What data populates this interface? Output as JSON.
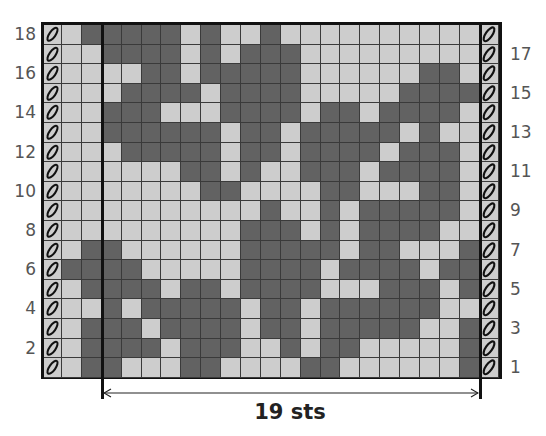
{
  "chart_data": {
    "type": "table",
    "title": "",
    "legend": {
      "D": "dark (contrast colour)",
      "L": "light (main colour)",
      "E": "edge slip stitch"
    },
    "colors": {
      "dark": "#626262",
      "light": "#cdcdcd",
      "grid": "#3a3a3a",
      "border": "#111111"
    },
    "repeat_label": "19 sts",
    "left_row_labels": [
      "18",
      "16",
      "14",
      "12",
      "10",
      "8",
      "6",
      "4",
      "2"
    ],
    "right_row_labels": [
      "17",
      "15",
      "13",
      "11",
      "9",
      "7",
      "5",
      "3",
      "1"
    ],
    "rows": [
      {
        "row": 18,
        "cells": "LDDDDDLDLLDLLLLLLLLLL"
      },
      {
        "row": 17,
        "cells": "LLDDDDLDLDDDLLLLLLLLL"
      },
      {
        "row": 16,
        "cells": "LLLLDDLDDDDDLLLLLLDDL"
      },
      {
        "row": 15,
        "cells": "LLLDDDDLDDDDLLLLLDDDD"
      },
      {
        "row": 14,
        "cells": "LLDDDLLLDDDDLDDLDDDDL"
      },
      {
        "row": 13,
        "cells": "LLDDDDDDLDDLDDDDDLDLL"
      },
      {
        "row": 12,
        "cells": "LLLDDDDDLDDLDDDDLDDDL"
      },
      {
        "row": 11,
        "cells": "LLLLLLDDLDLLDDDLDDDDL"
      },
      {
        "row": 10,
        "cells": "LLLLLLLDDLLLLDDLLLDDL"
      },
      {
        "row": 9,
        "cells": "LLLLLLLLLLDLLDLDDDDDL"
      },
      {
        "row": 8,
        "cells": "LLLLLLLLLDDDLDLDDDDLL"
      },
      {
        "row": 7,
        "cells": "LDDLLLLLLDDDDDLDDLLLD"
      },
      {
        "row": 6,
        "cells": "DDDDLLLLLDDDDLDDDDLDD"
      },
      {
        "row": 5,
        "cells": "LDDDDLDDLDDDDLLLDDDLD"
      },
      {
        "row": 4,
        "cells": "LLDLDDDDDLDDLDDDDDDLL"
      },
      {
        "row": 3,
        "cells": "LDDDLDDDDLDDLDDDDDLLD"
      },
      {
        "row": 2,
        "cells": "LDDDDLDDDLLDLDDLLLLLD"
      },
      {
        "row": 1,
        "cells": "LDDLLLDDLLLLDDLLLLLLD"
      }
    ],
    "columns_per_row": 21,
    "edge_columns": 2,
    "total_rows": 18
  }
}
